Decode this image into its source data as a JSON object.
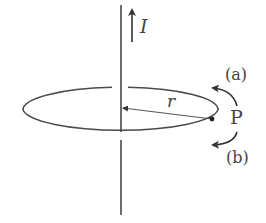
{
  "diagram": {
    "current_label": "I",
    "radius_label": "r",
    "point_label": "P",
    "direction_a_label": "(a)",
    "direction_b_label": "(b)",
    "colors": {
      "line": "#4a4a4a",
      "background": "#ffffff"
    }
  }
}
